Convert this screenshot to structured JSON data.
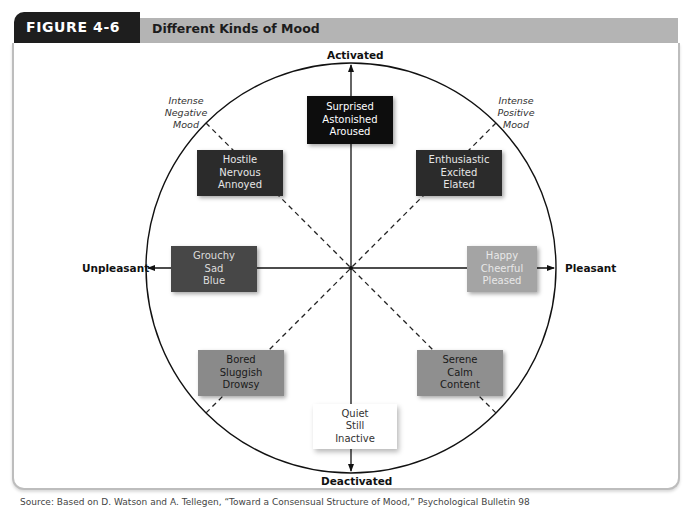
{
  "figure": {
    "number_label": "FIGURE 4-6",
    "title": "Different Kinds of Mood"
  },
  "axes": {
    "top": "Activated",
    "bottom": "Deactivated",
    "left": "Unpleasant",
    "right": "Pleasant"
  },
  "quadrant_labels": {
    "upper_left": [
      "Intense",
      "Negative",
      "Mood"
    ],
    "upper_right": [
      "Intense",
      "Positive",
      "Mood"
    ]
  },
  "moods": {
    "activated": {
      "words": [
        "Surprised",
        "Astonished",
        "Aroused"
      ],
      "bg": "#0d0d0d",
      "fg": "#ffffff"
    },
    "high_negative": {
      "words": [
        "Hostile",
        "Nervous",
        "Annoyed"
      ],
      "bg": "#2b2b2b",
      "fg": "#e6e6e6"
    },
    "high_positive": {
      "words": [
        "Enthusiastic",
        "Excited",
        "Elated"
      ],
      "bg": "#2b2b2b",
      "fg": "#e6e6e6"
    },
    "unpleasant": {
      "words": [
        "Grouchy",
        "Sad",
        "Blue"
      ],
      "bg": "#474747",
      "fg": "#dcdcdc"
    },
    "pleasant": {
      "words": [
        "Happy",
        "Cheerful",
        "Pleased"
      ],
      "bg": "#a4a4a4",
      "fg": "#e8e8e8"
    },
    "low_negative": {
      "words": [
        "Bored",
        "Sluggish",
        "Drowsy"
      ],
      "bg": "#8a8a8a",
      "fg": "#1a1a1a"
    },
    "low_positive": {
      "words": [
        "Serene",
        "Calm",
        "Content"
      ],
      "bg": "#8f8f8f",
      "fg": "#1a1a1a"
    },
    "deactivated": {
      "words": [
        "Quiet",
        "Still",
        "Inactive"
      ],
      "bg": "#ffffff",
      "fg": "#333333"
    }
  },
  "caption": "Source: Based on D. Watson and A. Tellegen, “Toward a Consensual Structure of Mood,” Psychological Bulletin 98"
}
